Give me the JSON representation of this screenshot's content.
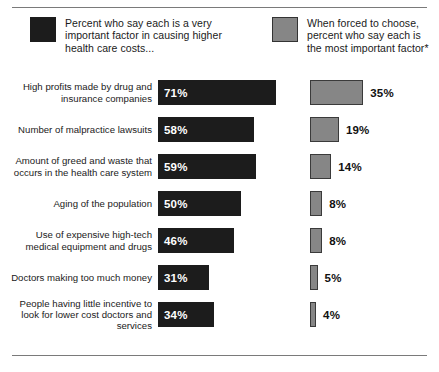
{
  "legend": {
    "dark": {
      "swatch": "dark-swatch",
      "text": "Percent who say each is a very important factor in causing higher health care costs..."
    },
    "gray": {
      "swatch": "gray-swatch",
      "text": "When forced to choose, percent who say each is the most important factor*"
    }
  },
  "colors": {
    "dark_series": "#1c1c1c",
    "gray_series": "#868686",
    "rule": "#7a7a7a",
    "background": "#ffffff",
    "dark_value_text": "#ffffff",
    "gray_value_text": "#111111"
  },
  "chart_data": {
    "type": "bar",
    "orientation": "horizontal",
    "title": "",
    "subtitle": "",
    "xlabel": "",
    "ylabel": "",
    "grid": false,
    "legend_position": "top",
    "xlim": [
      0,
      100
    ],
    "categories": [
      "High profits made by drug and insurance companies",
      "Number of malpractice lawsuits",
      "Amount of greed and waste that occurs in the health care system",
      "Aging of the population",
      "Use of expensive high-tech medical equipment and drugs",
      "Doctors making too much money",
      "People having little incentive to look for lower cost doctors and services"
    ],
    "series": [
      {
        "name": "Percent who say each is a very important factor in causing higher health care costs...",
        "color": "#1c1c1c",
        "values": [
          71,
          58,
          59,
          50,
          46,
          31,
          34
        ],
        "labels": [
          "71%",
          "58%",
          "59%",
          "50%",
          "46%",
          "31%",
          "34%"
        ]
      },
      {
        "name": "When forced to choose, percent who say each is the most important factor*",
        "color": "#868686",
        "values": [
          35,
          19,
          14,
          8,
          8,
          5,
          4
        ],
        "labels": [
          "35%",
          "19%",
          "14%",
          "8%",
          "8%",
          "5%",
          "4%"
        ]
      }
    ]
  },
  "rows": [
    {
      "label": "High profits made by drug and insurance companies",
      "label_lines": [
        "High profits made by drug and",
        "insurance companies"
      ],
      "dark_value": 71,
      "dark_label": "71%",
      "gray_value": 35,
      "gray_label": "35%"
    },
    {
      "label": "Number of malpractice lawsuits",
      "label_lines": [
        "Number of malpractice lawsuits"
      ],
      "dark_value": 58,
      "dark_label": "58%",
      "gray_value": 19,
      "gray_label": "19%"
    },
    {
      "label": "Amount of greed and waste that occurs in the health care system",
      "label_lines": [
        "Amount of greed and waste that",
        "occurs in the health care system"
      ],
      "dark_value": 59,
      "dark_label": "59%",
      "gray_value": 14,
      "gray_label": "14%"
    },
    {
      "label": "Aging of the population",
      "label_lines": [
        "Aging of the population"
      ],
      "dark_value": 50,
      "dark_label": "50%",
      "gray_value": 8,
      "gray_label": "8%"
    },
    {
      "label": "Use of expensive high-tech medical equipment and drugs",
      "label_lines": [
        "Use of expensive high-tech",
        "medical equipment and drugs"
      ],
      "dark_value": 46,
      "dark_label": "46%",
      "gray_value": 8,
      "gray_label": "8%"
    },
    {
      "label": "Doctors making too much money",
      "label_lines": [
        "Doctors making too much money"
      ],
      "dark_value": 31,
      "dark_label": "31%",
      "gray_value": 5,
      "gray_label": "5%"
    },
    {
      "label": "People having little incentive to look for lower cost doctors and services",
      "label_lines": [
        "People having little incentive to",
        "look for lower cost doctors and",
        "services"
      ],
      "dark_value": 34,
      "dark_label": "34%",
      "gray_value": 4,
      "gray_label": "4%"
    }
  ]
}
